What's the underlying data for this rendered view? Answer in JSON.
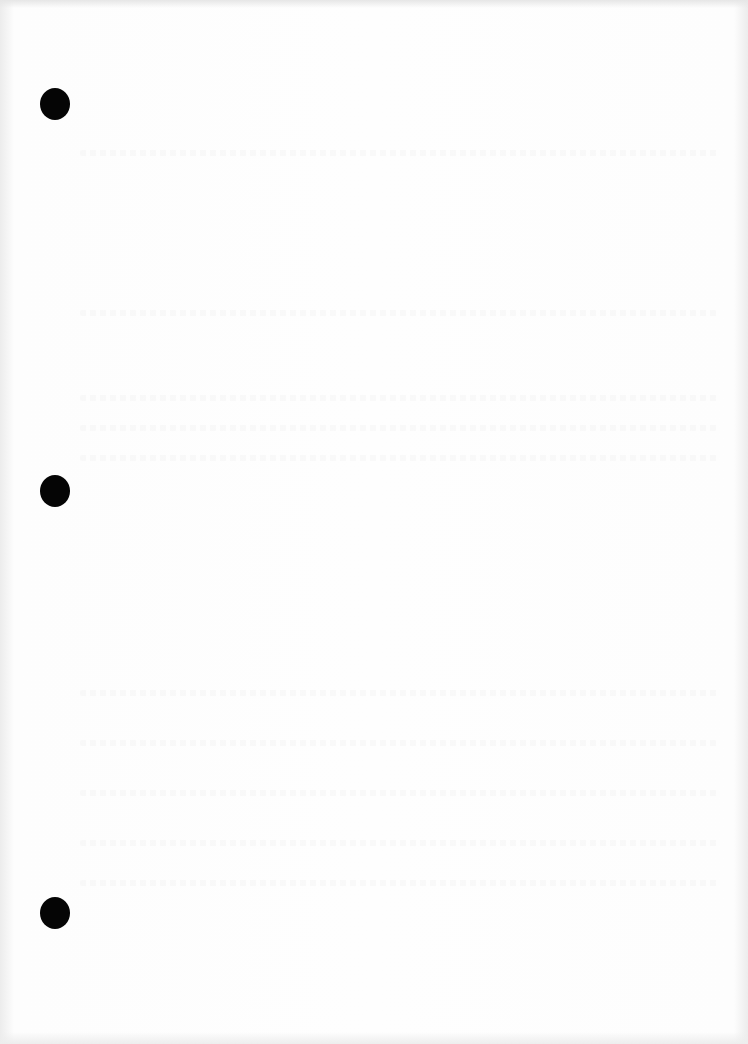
{
  "document": {
    "type": "blank-scanned-page",
    "text": "",
    "holes": [
      {
        "name": "hole-top",
        "top": 88
      },
      {
        "name": "hole-middle",
        "top": 475
      },
      {
        "name": "hole-bottom",
        "top": 897
      }
    ],
    "colors": {
      "paper": "#fefefe",
      "hole": "#050505"
    }
  }
}
